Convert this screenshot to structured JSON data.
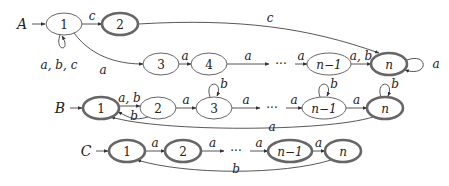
{
  "diagram": {
    "type": "finite-automata",
    "colors": {
      "stroke": "#555555",
      "accept_stroke": "#666666",
      "text": "#222222",
      "background": "#ffffff"
    },
    "automata": [
      {
        "name": "A",
        "states": [
          {
            "id": "A1",
            "label": "1",
            "accepting": false,
            "x": 64,
            "y": 24
          },
          {
            "id": "A2",
            "label": "2",
            "accepting": true,
            "x": 120,
            "y": 24
          },
          {
            "id": "A3",
            "label": "3",
            "accepting": false,
            "x": 161,
            "y": 64
          },
          {
            "id": "A4",
            "label": "4",
            "accepting": false,
            "x": 209,
            "y": 64
          },
          {
            "id": "Adots",
            "label": "···",
            "accepting": false,
            "x": 281,
            "y": 64,
            "ellipsis": true
          },
          {
            "id": "An1",
            "label": "n−1",
            "accepting": false,
            "x": 329,
            "y": 64
          },
          {
            "id": "An",
            "label": "n",
            "accepting": true,
            "x": 389,
            "y": 64
          }
        ],
        "transitions": [
          {
            "from": "A1",
            "to": "A1",
            "label": "a, b, c"
          },
          {
            "from": "A1",
            "to": "A2",
            "label": "c"
          },
          {
            "from": "A2",
            "to": "An",
            "label": "c"
          },
          {
            "from": "A1",
            "to": "A3",
            "label": "a"
          },
          {
            "from": "A3",
            "to": "A4",
            "label": "a"
          },
          {
            "from": "A4",
            "to": "Adots",
            "label": "a"
          },
          {
            "from": "Adots",
            "to": "An1",
            "label": "a"
          },
          {
            "from": "An1",
            "to": "An",
            "label": "a, b"
          },
          {
            "from": "An",
            "to": "An",
            "label": "a"
          }
        ]
      },
      {
        "name": "B",
        "states": [
          {
            "id": "B1",
            "label": "1",
            "accepting": true,
            "x": 101,
            "y": 108
          },
          {
            "id": "B2",
            "label": "2",
            "accepting": false,
            "x": 158,
            "y": 108
          },
          {
            "id": "B3",
            "label": "3",
            "accepting": false,
            "x": 214,
            "y": 108
          },
          {
            "id": "Bdots",
            "label": "···",
            "accepting": false,
            "x": 272,
            "y": 108,
            "ellipsis": true
          },
          {
            "id": "Bn1",
            "label": "n−1",
            "accepting": false,
            "x": 324,
            "y": 108
          },
          {
            "id": "Bn",
            "label": "n",
            "accepting": true,
            "x": 385,
            "y": 108
          }
        ],
        "transitions": [
          {
            "from": "B1",
            "to": "B2",
            "label": "a, b"
          },
          {
            "from": "B2",
            "to": "B1",
            "label": "b"
          },
          {
            "from": "B2",
            "to": "B3",
            "label": "a"
          },
          {
            "from": "B3",
            "to": "B3",
            "label": "b"
          },
          {
            "from": "B3",
            "to": "Bdots",
            "label": "a"
          },
          {
            "from": "Bdots",
            "to": "Bn1",
            "label": "a"
          },
          {
            "from": "Bn1",
            "to": "Bn1",
            "label": "b"
          },
          {
            "from": "Bn1",
            "to": "Bn",
            "label": "a"
          },
          {
            "from": "Bn",
            "to": "Bn",
            "label": "b"
          },
          {
            "from": "Bn",
            "to": "B1",
            "label": "a"
          }
        ]
      },
      {
        "name": "C",
        "states": [
          {
            "id": "C1",
            "label": "1",
            "accepting": true,
            "x": 127,
            "y": 151
          },
          {
            "id": "C2",
            "label": "2",
            "accepting": true,
            "x": 183,
            "y": 151
          },
          {
            "id": "Cdots",
            "label": "···",
            "accepting": false,
            "x": 236,
            "y": 151,
            "ellipsis": true
          },
          {
            "id": "Cn1",
            "label": "n−1",
            "accepting": true,
            "x": 290,
            "y": 151
          },
          {
            "id": "Cn",
            "label": "n",
            "accepting": true,
            "x": 343,
            "y": 151
          }
        ],
        "transitions": [
          {
            "from": "C1",
            "to": "C2",
            "label": "a"
          },
          {
            "from": "C2",
            "to": "Cdots",
            "label": "a"
          },
          {
            "from": "Cdots",
            "to": "Cn1",
            "label": "a"
          },
          {
            "from": "Cn1",
            "to": "Cn",
            "label": "a"
          },
          {
            "from": "Cn",
            "to": "C1",
            "label": "b"
          }
        ]
      }
    ]
  }
}
